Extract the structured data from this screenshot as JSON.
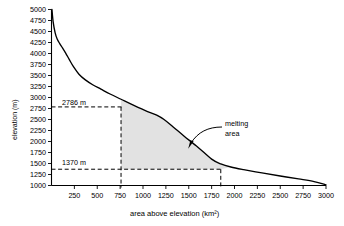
{
  "chart_data": {
    "type": "line",
    "title": "",
    "xlabel": "area above elevation (km²)",
    "ylabel": "elevation (m)",
    "xlim": [
      0,
      3000
    ],
    "ylim": [
      1000,
      5000
    ],
    "xticks": [
      250,
      500,
      750,
      1000,
      1250,
      1500,
      1750,
      2000,
      2250,
      2500,
      2750,
      3000
    ],
    "yticks": [
      1000,
      1250,
      1500,
      1750,
      2000,
      2250,
      2500,
      2750,
      3000,
      3250,
      3500,
      3750,
      4000,
      4250,
      4500,
      4750,
      5000
    ],
    "grid": false,
    "legend": null,
    "series": [
      {
        "name": "hypsometric curve",
        "x": [
          5,
          18,
          40,
          62,
          90,
          120,
          155,
          195,
          240,
          300,
          370,
          450,
          540,
          640,
          760,
          900,
          1050,
          1150,
          1230,
          1330,
          1450,
          1600,
          1750,
          1850,
          1960,
          2100,
          2300,
          2500,
          2700,
          2870,
          3000
        ],
        "y": [
          5000,
          4720,
          4470,
          4330,
          4225,
          4130,
          4010,
          3860,
          3700,
          3530,
          3400,
          3290,
          3190,
          3080,
          2960,
          2820,
          2680,
          2600,
          2500,
          2330,
          2120,
          1870,
          1600,
          1490,
          1420,
          1360,
          1285,
          1215,
          1150,
          1090,
          1015
        ]
      }
    ],
    "annotations": [
      {
        "name": "upper-elevation-marker",
        "label": "2786 m",
        "value": 2786,
        "type": "hline"
      },
      {
        "name": "lower-elevation-marker",
        "label": "1370 m",
        "value": 1370,
        "type": "hline"
      },
      {
        "name": "left-area-marker",
        "value": 760,
        "type": "vline"
      },
      {
        "name": "right-area-marker",
        "value": 1850,
        "type": "vline"
      },
      {
        "name": "melting-area-callout",
        "label_line1": "melting",
        "label_line2": "area"
      }
    ],
    "shaded_region": {
      "name": "melting area",
      "fill_color": "#e2e2e2",
      "top_elevation": 2786,
      "bottom_elevation": 1370,
      "left_area": 760,
      "right_area": 1850
    }
  },
  "axis": {
    "x_tick_labels": [
      "250",
      "500",
      "750",
      "1000",
      "1250",
      "1500",
      "1750",
      "2000",
      "2250",
      "2500",
      "2750",
      "3000"
    ],
    "y_tick_labels": [
      "1000",
      "1250",
      "1500",
      "1750",
      "2000",
      "2250",
      "2500",
      "2750",
      "3000",
      "3250",
      "3500",
      "3750",
      "4000",
      "4250",
      "4500",
      "4750",
      "5000"
    ],
    "x_title": "area above elevation (km²)",
    "y_title": "elevation (m)"
  },
  "labels": {
    "upper_marker": "2786 m",
    "lower_marker": "1370 m",
    "melting_line1": "melting",
    "melting_line2": "area"
  }
}
